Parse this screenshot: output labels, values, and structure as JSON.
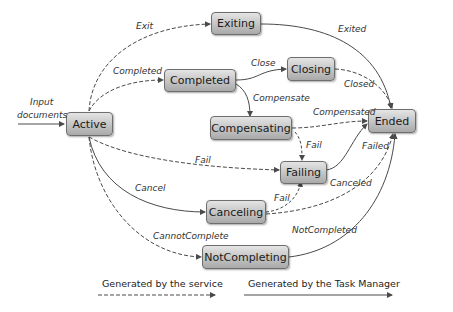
{
  "states": {
    "active": "Active",
    "exiting": "Exiting",
    "completed": "Completed",
    "closing": "Closing",
    "compensating": "Compensating",
    "ended": "Ended",
    "failing": "Failing",
    "canceling": "Canceling",
    "not_completing": "NotCompleting"
  },
  "input": {
    "line1": "Input",
    "line2": "documents"
  },
  "transitions": {
    "exit": "Exit",
    "exited": "Exited",
    "completed": "Completed",
    "close": "Close",
    "closed": "Closed",
    "compensate": "Compensate",
    "compensated": "Compensated",
    "fail_active": "Fail",
    "fail_compensating": "Fail",
    "failed": "Failed",
    "canceled": "Canceled",
    "cancel": "Cancel",
    "fail_canceling": "Fail",
    "cannot_complete": "CannotComplete",
    "not_completed": "NotCompleted"
  },
  "legend": {
    "service": "Generated by the service",
    "task_manager": "Generated by the Task Manager"
  },
  "colors": {
    "edge": "#4a4a4a",
    "box_top": "#e4e4e4",
    "box_bottom": "#a9a9a9"
  }
}
